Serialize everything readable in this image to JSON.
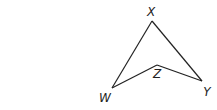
{
  "diagram": {
    "type": "geometry-figure",
    "shape": "concave quadrilateral (dart)",
    "stroke_color": "#222222",
    "background": "#ffffff",
    "vertices": [
      {
        "name": "X",
        "x": 152,
        "y": 21,
        "label_x": 151,
        "label_y": 16
      },
      {
        "name": "Y",
        "x": 202,
        "y": 81,
        "label_x": 207,
        "label_y": 96
      },
      {
        "name": "Z",
        "x": 157,
        "y": 65,
        "label_x": 157,
        "label_y": 78
      },
      {
        "name": "W",
        "x": 112,
        "y": 88,
        "label_x": 105,
        "label_y": 102
      }
    ],
    "edges": [
      {
        "from": "X",
        "to": "Y"
      },
      {
        "from": "Y",
        "to": "Z"
      },
      {
        "from": "Z",
        "to": "W"
      },
      {
        "from": "W",
        "to": "X"
      }
    ]
  }
}
